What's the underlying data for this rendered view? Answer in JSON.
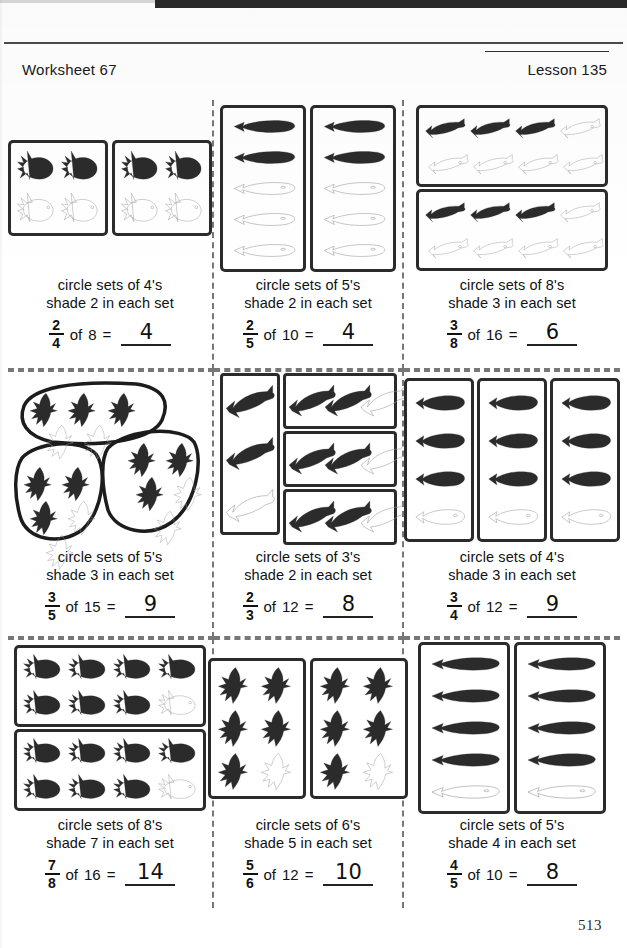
{
  "page": {
    "worksheet_label": "Worksheet 67",
    "lesson_label": "Lesson 135",
    "page_number": "513",
    "ink_color": "#1a1a1a",
    "rule_color": "#4a4a4a",
    "separator_color": "#777777"
  },
  "problems": [
    {
      "id": "p1",
      "instruction_line1": "circle sets of 4's",
      "instruction_line2": "shade 2 in each set",
      "numerator": "2",
      "denominator": "4",
      "of_text": "of",
      "total": "8",
      "equals": "=",
      "answer": "4",
      "fish_kind": "goldfish",
      "groups": 2,
      "per_group": 4,
      "shaded_per_group": 2,
      "layout": "two-vertical-boxes",
      "grid_cols": 2,
      "grid_rows": 2
    },
    {
      "id": "p2",
      "instruction_line1": "circle sets of 5's",
      "instruction_line2": "shade 2 in each set",
      "numerator": "2",
      "denominator": "5",
      "of_text": "of",
      "total": "10",
      "equals": "=",
      "answer": "4",
      "fish_kind": "tuna",
      "groups": 2,
      "per_group": 5,
      "shaded_per_group": 2,
      "layout": "two-tall-boxes",
      "grid_cols": 1,
      "grid_rows": 5
    },
    {
      "id": "p3",
      "instruction_line1": "circle sets of 8's",
      "instruction_line2": "shade 3 in each set",
      "numerator": "3",
      "denominator": "8",
      "of_text": "of",
      "total": "16",
      "equals": "=",
      "answer": "6",
      "fish_kind": "trout",
      "groups": 2,
      "per_group": 8,
      "shaded_per_group": 3,
      "layout": "two-wide-boxes",
      "grid_cols": 4,
      "grid_rows": 2
    },
    {
      "id": "p4",
      "instruction_line1": "circle sets of 5's",
      "instruction_line2": "shade 3 in each set",
      "numerator": "3",
      "denominator": "5",
      "of_text": "of",
      "total": "15",
      "equals": "=",
      "answer": "9",
      "fish_kind": "angelfish",
      "groups": 3,
      "per_group": 5,
      "shaded_per_group": 3,
      "layout": "hand-drawn-blobs",
      "grid_cols": 3,
      "grid_rows": 2
    },
    {
      "id": "p5",
      "instruction_line1": "circle sets of 3's",
      "instruction_line2": "shade 2 in each set",
      "numerator": "2",
      "denominator": "3",
      "of_text": "of",
      "total": "12",
      "equals": "=",
      "answer": "8",
      "fish_kind": "shark",
      "groups": 4,
      "per_group": 3,
      "shaded_per_group": 2,
      "layout": "one-tall-three-wide",
      "grid_cols": 3,
      "grid_rows": 1
    },
    {
      "id": "p6",
      "instruction_line1": "circle sets of 4's",
      "instruction_line2": "shade 3 in each set",
      "numerator": "3",
      "denominator": "4",
      "of_text": "of",
      "total": "12",
      "equals": "=",
      "answer": "9",
      "fish_kind": "tuna",
      "groups": 3,
      "per_group": 4,
      "shaded_per_group": 3,
      "layout": "three-vertical-boxes",
      "grid_cols": 1,
      "grid_rows": 4
    },
    {
      "id": "p7",
      "instruction_line1": "circle sets of 8's",
      "instruction_line2": "shade 7 in each set",
      "numerator": "7",
      "denominator": "8",
      "of_text": "of",
      "total": "16",
      "equals": "=",
      "answer": "14",
      "fish_kind": "goldfish",
      "groups": 2,
      "per_group": 8,
      "shaded_per_group": 7,
      "layout": "two-wide-boxes",
      "grid_cols": 4,
      "grid_rows": 2
    },
    {
      "id": "p8",
      "instruction_line1": "circle sets of 6's",
      "instruction_line2": "shade 5 in each set",
      "numerator": "5",
      "denominator": "6",
      "of_text": "of",
      "total": "12",
      "equals": "=",
      "answer": "10",
      "fish_kind": "angelfish",
      "groups": 2,
      "per_group": 6,
      "shaded_per_group": 5,
      "layout": "two-vertical-boxes",
      "grid_cols": 2,
      "grid_rows": 3
    },
    {
      "id": "p9",
      "instruction_line1": "circle sets of 5's",
      "instruction_line2": "shade 4 in each set",
      "numerator": "4",
      "denominator": "5",
      "of_text": "of",
      "total": "10",
      "equals": "=",
      "answer": "8",
      "fish_kind": "tuna",
      "groups": 2,
      "per_group": 5,
      "shaded_per_group": 4,
      "layout": "two-vertical-boxes",
      "grid_cols": 1,
      "grid_rows": 5
    }
  ]
}
